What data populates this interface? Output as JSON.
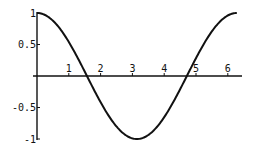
{
  "chart_data": {
    "type": "line",
    "title": "",
    "xlabel": "",
    "ylabel": "",
    "function": "cos(x)",
    "xlim": [
      0,
      6.2832
    ],
    "ylim": [
      -1,
      1
    ],
    "grid": false,
    "legend": null,
    "x_ticks": [
      "1",
      "2",
      "3",
      "4",
      "5",
      "6"
    ],
    "y_ticks": [
      "1",
      "0.5",
      "-0.5",
      "-1"
    ],
    "series": [
      {
        "name": "cos(x)",
        "x": [
          0,
          0.5,
          1,
          1.5,
          2,
          2.5,
          3,
          3.1416,
          3.5,
          4,
          4.5,
          5,
          5.5,
          6,
          6.2832
        ],
        "y": [
          1,
          0.878,
          0.54,
          0.071,
          -0.416,
          -0.801,
          -0.99,
          -1,
          -0.936,
          -0.654,
          -0.211,
          0.284,
          0.709,
          0.96,
          1
        ]
      }
    ],
    "colors": {
      "line": "#111111",
      "axes": "#111111",
      "background": "#ffffff"
    }
  }
}
